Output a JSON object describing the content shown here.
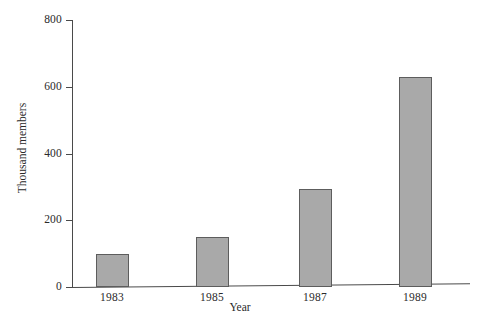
{
  "chart_data": {
    "type": "bar",
    "title": "",
    "xlabel": "Year",
    "ylabel": "Thousand members",
    "categories": [
      "1983",
      "1985",
      "1987",
      "1989"
    ],
    "values": [
      100,
      150,
      295,
      630
    ],
    "series": [
      {
        "name": "Thousand members",
        "values": [
          100,
          150,
          295,
          630
        ]
      }
    ],
    "ylim": [
      0,
      800
    ],
    "y_ticks": [
      0,
      200,
      400,
      600,
      800
    ],
    "y_tick_labels": [
      "0",
      "200",
      "400",
      "600",
      "800"
    ],
    "x_tick_labels": [
      "1983",
      "1985",
      "1987",
      "1989"
    ],
    "grid": false,
    "legend": false,
    "legend_position": "none",
    "bar_color": "#a9a9a9",
    "bar_border_color": "#5d5d5d",
    "axis_color": "#4a4a4a",
    "background_color": "#ffffff"
  },
  "axes": {
    "y_title": "Thousand members",
    "x_title": "Year"
  }
}
